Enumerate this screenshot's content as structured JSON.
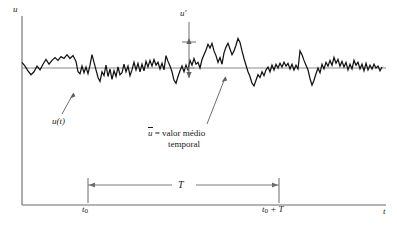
{
  "figure": {
    "caption_axes": {
      "y_axis_label": "u",
      "x_axis_label": "t"
    },
    "annotations": {
      "fluctuation_label": "u′",
      "signal_label": "u(t)",
      "mean_label_symbol": "u",
      "mean_label_text": "=  valor médio",
      "mean_label_text2": "temporal",
      "interval_label": "T",
      "t0_label": "t",
      "t0_sub": "0",
      "t0T_label": "t",
      "t0T_sub": "0",
      "t0T_rest": " + T"
    },
    "colors": {
      "axis": "#6b6b6b",
      "signal": "#121212",
      "mean_line": "#8a8a8a",
      "annotation": "#5f5f5f",
      "background": "#ffffff"
    },
    "geometry": {
      "y_axis_x": 22,
      "y_axis_top": 16,
      "x_axis_y": 205,
      "x_axis_right": 386,
      "mean_line_y": 68,
      "mean_line_x0": 22,
      "mean_line_x1": 386,
      "t0_x": 88,
      "t0T_x": 279,
      "bracket_y": 185
    },
    "chart_data": {
      "type": "line",
      "title": "",
      "xlabel": "t",
      "ylabel": "u",
      "description": "Turbulent velocity signal u(t) fluctuating about its time-average mean value over an averaging interval T from t0 to t0+T",
      "mean_value": 0,
      "series_name": "u(t)",
      "x": [
        22,
        25,
        28,
        31,
        34,
        37,
        40,
        43,
        46,
        49,
        52,
        55,
        58,
        61,
        64,
        67,
        70,
        73,
        74,
        76,
        78,
        80,
        82,
        84,
        86,
        88,
        90,
        92,
        94,
        96,
        98,
        100,
        102,
        104,
        106,
        108,
        110,
        112,
        114,
        116,
        118,
        120,
        122,
        124,
        126,
        128,
        130,
        132,
        134,
        136,
        138,
        140,
        142,
        144,
        146,
        148,
        150,
        152,
        154,
        156,
        158,
        160,
        162,
        164,
        166,
        168,
        170,
        172,
        174,
        176,
        178,
        180,
        182,
        184,
        186,
        188,
        190,
        192,
        194,
        196,
        198,
        200,
        202,
        204,
        206,
        208,
        210,
        212,
        214,
        216,
        218,
        220,
        222,
        224,
        226,
        228,
        230,
        232,
        234,
        236,
        238,
        240,
        242,
        244,
        246,
        248,
        250,
        252,
        254,
        256,
        258,
        260,
        262,
        264,
        266,
        268,
        270,
        272,
        274,
        276,
        278,
        280,
        282,
        284,
        286,
        288,
        290,
        292,
        294,
        296,
        298,
        300,
        302,
        304,
        306,
        308,
        310,
        312,
        314,
        316,
        318,
        320,
        322,
        324,
        326,
        328,
        330,
        332,
        334,
        336,
        338,
        340,
        342,
        344,
        346,
        348,
        350,
        352,
        354,
        356,
        358,
        360,
        362,
        364,
        366,
        368,
        370,
        372,
        374,
        376,
        378,
        380,
        382
      ],
      "y": [
        6,
        2,
        -3,
        -7,
        -4,
        2,
        -2,
        4,
        9,
        4,
        8,
        11,
        8,
        12,
        10,
        14,
        10,
        13,
        11,
        7,
        -4,
        -6,
        2,
        -5,
        1,
        -6,
        3,
        14,
        6,
        -2,
        -10,
        -14,
        -4,
        -8,
        3,
        -9,
        -1,
        -12,
        -3,
        -9,
        1,
        -7,
        -5,
        4,
        -4,
        2,
        -8,
        -2,
        6,
        -2,
        5,
        -4,
        4,
        -3,
        7,
        1,
        8,
        2,
        9,
        3,
        6,
        -1,
        5,
        -2,
        13,
        7,
        2,
        -4,
        -13,
        -16,
        -9,
        -3,
        2,
        -4,
        3,
        -2,
        8,
        3,
        10,
        4,
        6,
        0,
        9,
        14,
        19,
        25,
        21,
        26,
        18,
        13,
        6,
        11,
        4,
        16,
        22,
        26,
        20,
        14,
        18,
        24,
        31,
        27,
        18,
        10,
        3,
        -4,
        -9,
        -16,
        -19,
        -13,
        -7,
        -10,
        -4,
        -8,
        -2,
        1,
        -4,
        3,
        -2,
        4,
        0,
        5,
        1,
        6,
        2,
        5,
        -1,
        4,
        -2,
        3,
        -1,
        18,
        14,
        8,
        3,
        -2,
        -11,
        -18,
        -13,
        -6,
        0,
        -5,
        4,
        -1,
        6,
        2,
        8,
        3,
        11,
        5,
        9,
        2,
        7,
        1,
        6,
        -2,
        4,
        -1,
        8,
        3,
        6,
        -1,
        4,
        -3,
        5,
        -2,
        3,
        -1,
        4,
        0,
        2,
        -3,
        1,
        -2
      ]
    }
  }
}
